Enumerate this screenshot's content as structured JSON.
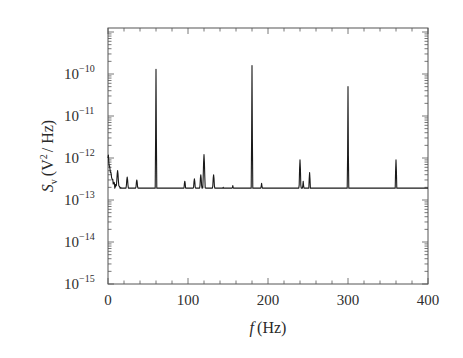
{
  "chart_data": {
    "type": "line",
    "title": "",
    "xlabel": "f (Hz)",
    "ylabel": "S_v (V^2/Hz)",
    "xlabel_parts": {
      "var": "f",
      "unit": "(Hz)"
    },
    "ylabel_parts": {
      "var": "S",
      "sub": "v",
      "unit_pre": "(V",
      "unit_sup": "2",
      "unit_post": "/ Hz)"
    },
    "xlim": [
      0,
      400
    ],
    "ylim": [
      1e-15,
      1.3e-09
    ],
    "yscale": "log",
    "grid": false,
    "legend": null,
    "x_ticks": [
      0,
      100,
      200,
      300,
      400
    ],
    "x_tick_labels": [
      "0",
      "100",
      "200",
      "300",
      "400"
    ],
    "y_ticks": [
      -15,
      -14,
      -13,
      -12,
      -11,
      -10
    ],
    "y_tick_labels": [
      "10^-15",
      "10^-14",
      "10^-13",
      "10^-12",
      "10^-11",
      "10^-10"
    ],
    "y_tick_base": "10",
    "y_tick_exps": [
      "−15",
      "−14",
      "−13",
      "−12",
      "−11",
      "−10"
    ],
    "series": [
      {
        "name": "noise spectral density",
        "color": "#1a1a1a",
        "baseline": [
          {
            "f": 0,
            "v": 1.2e-12
          },
          {
            "f": 2,
            "v": 6e-13
          },
          {
            "f": 5,
            "v": 3e-13
          },
          {
            "f": 10,
            "v": 2e-13
          },
          {
            "f": 20,
            "v": 1.6e-13
          },
          {
            "f": 50,
            "v": 1.5e-13
          },
          {
            "f": 100,
            "v": 1.45e-13
          },
          {
            "f": 150,
            "v": 1.3e-13
          },
          {
            "f": 200,
            "v": 1e-13
          },
          {
            "f": 250,
            "v": 7.5e-14
          },
          {
            "f": 300,
            "v": 6e-14
          },
          {
            "f": 350,
            "v": 4.2e-14
          },
          {
            "f": 400,
            "v": 3e-14
          }
        ],
        "peaks": [
          {
            "f": 12,
            "v": 5e-13
          },
          {
            "f": 24,
            "v": 3.5e-13
          },
          {
            "f": 36,
            "v": 3e-13
          },
          {
            "f": 60,
            "v": 1.3e-10
          },
          {
            "f": 96,
            "v": 2.8e-13
          },
          {
            "f": 108,
            "v": 3.2e-13
          },
          {
            "f": 116,
            "v": 4e-13
          },
          {
            "f": 120,
            "v": 1.2e-12
          },
          {
            "f": 132,
            "v": 4e-13
          },
          {
            "f": 144,
            "v": 2e-13
          },
          {
            "f": 156,
            "v": 2.2e-13
          },
          {
            "f": 180,
            "v": 1.6e-10
          },
          {
            "f": 192,
            "v": 2.5e-13
          },
          {
            "f": 216,
            "v": 1.4e-13
          },
          {
            "f": 228,
            "v": 1.6e-13
          },
          {
            "f": 240,
            "v": 9e-13
          },
          {
            "f": 244,
            "v": 2.8e-13
          },
          {
            "f": 252,
            "v": 4.5e-13
          },
          {
            "f": 264,
            "v": 1.1e-13
          },
          {
            "f": 300,
            "v": 5e-11
          },
          {
            "f": 312,
            "v": 1.1e-13
          },
          {
            "f": 324,
            "v": 7e-14
          },
          {
            "f": 336,
            "v": 5.5e-14
          },
          {
            "f": 360,
            "v": 9e-13
          },
          {
            "f": 368,
            "v": 7e-14
          }
        ]
      }
    ],
    "annotations": []
  },
  "layout": {
    "plot_left": 108,
    "plot_right": 428,
    "plot_top": 28,
    "plot_bottom": 284,
    "decade_px": 42
  }
}
